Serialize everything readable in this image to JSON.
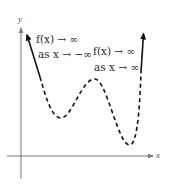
{
  "figure": {
    "axes": {
      "x_label": "x",
      "y_label": "y"
    },
    "annotations": {
      "left": {
        "line1": "f(x) → ∞",
        "line2": "as x → −∞"
      },
      "right": {
        "line1": "f(x) → ∞",
        "line2": "as x → ∞"
      }
    },
    "curve": {
      "description": "End behavior of a polynomial: both ends rise; middle portion dashed with two local minima and one local maximum",
      "left_end": "rises (solid arrow up-left)",
      "right_end": "rises (solid arrow up-right)",
      "turning_points": [
        "local min",
        "local max",
        "local min"
      ]
    },
    "colors": {
      "curve": "#111111",
      "axes": "#777777",
      "text": "#2a2a2a"
    }
  }
}
